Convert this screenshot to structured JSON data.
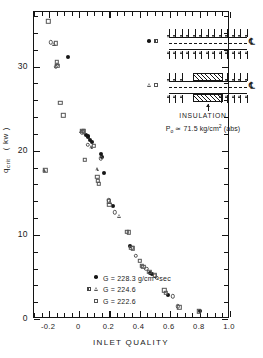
{
  "chart_data": {
    "type": "scatter",
    "title": "",
    "xlabel": "INLET QUALITY",
    "ylabel": "q crit ( kw )",
    "ylabel_base": "q",
    "ylabel_sub": "crit",
    "ylabel_units": "( kw )",
    "xlim": [
      -0.3,
      1.0
    ],
    "ylim": [
      0,
      36.5
    ],
    "xticks": [
      -0.2,
      0,
      0.2,
      0.4,
      0.6,
      0.8,
      1.0
    ],
    "xticklabels": [
      "-0.2",
      "0",
      "0.2",
      "0.4",
      "0.6",
      "0.8",
      "1.0"
    ],
    "yticks": [
      0,
      10,
      20,
      30
    ],
    "yticklabels": [
      "0",
      "10",
      "20",
      "30"
    ],
    "x_minor_step": 0.05,
    "y_minor_step": 2,
    "grid": false,
    "legend_position": "lower-left-inside",
    "series": [
      {
        "name": "G = 228.3 g/cm2-sec",
        "marker": "circle-filled",
        "points": [
          [
            -0.075,
            31.2
          ],
          [
            0.045,
            21.9
          ],
          [
            0.055,
            21.6
          ],
          [
            0.06,
            21.8
          ],
          [
            0.07,
            21.3
          ],
          [
            0.085,
            21.1
          ],
          [
            0.145,
            19.6
          ],
          [
            0.15,
            19.3
          ],
          [
            0.165,
            17.4
          ],
          [
            0.225,
            13.4
          ],
          [
            0.335,
            8.7
          ],
          [
            0.47,
            5.5
          ],
          [
            0.485,
            5.4
          ],
          [
            0.59,
            2.9
          ],
          [
            0.8,
            1.0
          ]
        ]
      },
      {
        "name": "G = 224.6",
        "marker": "triangle-open",
        "points": [
          [
            -0.235,
            17.7
          ],
          [
            -0.165,
            32.7
          ],
          [
            -0.145,
            30.3
          ],
          [
            0.015,
            22.3
          ],
          [
            0.075,
            20.4
          ],
          [
            0.115,
            17.8
          ],
          [
            0.205,
            13.9
          ],
          [
            0.265,
            12.3
          ]
        ]
      },
      {
        "name": "G = 222.6",
        "marker": "square-open",
        "points": [
          [
            -0.225,
            17.7
          ],
          [
            -0.205,
            35.4
          ],
          [
            -0.155,
            32.8
          ],
          [
            -0.15,
            30.5
          ],
          [
            -0.145,
            30.1
          ],
          [
            -0.125,
            25.7
          ],
          [
            -0.105,
            24.2
          ],
          [
            0.02,
            22.4
          ],
          [
            0.03,
            22.3
          ],
          [
            0.035,
            18.9
          ],
          [
            0.095,
            20.6
          ],
          [
            0.12,
            16.9
          ],
          [
            0.125,
            16.4
          ],
          [
            0.13,
            16.1
          ],
          [
            0.195,
            14.0
          ],
          [
            0.2,
            13.6
          ],
          [
            0.315,
            10.4
          ],
          [
            0.33,
            10.3
          ],
          [
            0.345,
            8.5
          ],
          [
            0.355,
            8.4
          ],
          [
            0.4,
            6.9
          ],
          [
            0.415,
            6.3
          ],
          [
            0.425,
            6.2
          ],
          [
            0.465,
            5.6
          ],
          [
            0.5,
            5.2
          ],
          [
            0.565,
            3.4
          ],
          [
            0.575,
            3.1
          ],
          [
            0.665,
            1.4
          ],
          [
            0.795,
            0.9
          ]
        ]
      },
      {
        "name": "G = 224.6 open-circle points",
        "marker": "circle-open",
        "points": [
          [
            -0.19,
            32.9
          ],
          [
            -0.155,
            30.0
          ],
          [
            0.02,
            22.2
          ],
          [
            0.055,
            20.7
          ],
          [
            0.145,
            19.1
          ],
          [
            0.195,
            14.1
          ],
          [
            0.235,
            12.7
          ],
          [
            0.375,
            7.5
          ],
          [
            0.445,
            6.0
          ],
          [
            0.515,
            4.9
          ],
          [
            0.62,
            2.7
          ],
          [
            0.655,
            1.5
          ]
        ]
      }
    ]
  },
  "legend": {
    "rows": [
      {
        "markers": [
          "circle-filled"
        ],
        "text_pre": "G = 228.3 g/cm",
        "sup": "2",
        "text_post": "-sec"
      },
      {
        "markers": [
          "square-half",
          "triangle-open"
        ],
        "text_pre": "G = 224.6",
        "sup": "",
        "text_post": ""
      },
      {
        "markers": [
          "square-open"
        ],
        "text_pre": "G = 222.6",
        "sup": "",
        "text_post": ""
      }
    ]
  },
  "inset": {
    "top_markers": [
      "circle-filled",
      "square-half"
    ],
    "bottom_markers": [
      "triangle-open",
      "square-open"
    ],
    "centerline_symbol": "℄",
    "caption": "INSULATION",
    "pressure_pre": "P",
    "pressure_sub": "o",
    "pressure_post": " ≃ 71.5 kg/cm",
    "pressure_sup": "2",
    "pressure_tail": " (abs)"
  }
}
